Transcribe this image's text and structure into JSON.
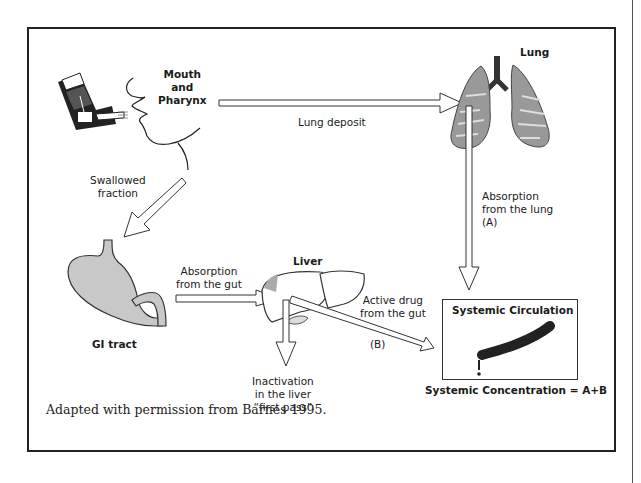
{
  "figure": {
    "caption": "Adapted with permission from Barnes 1995.",
    "nodes": {
      "mouth": {
        "label_line1": "Mouth",
        "label_line2": "and",
        "label_line3": "Pharynx",
        "icon": "inhaler-and-face-icon"
      },
      "lung": {
        "label": "Lung",
        "icon": "lungs-icon"
      },
      "gi_tract": {
        "label": "GI tract",
        "icon": "stomach-icon"
      },
      "liver": {
        "label": "Liver",
        "icon": "liver-icon"
      },
      "systemic": {
        "label": "Systemic Circulation",
        "icon": "blood-vessel-icon",
        "concentration": "Systemic Concentration = A+B"
      }
    },
    "edges": {
      "lung_deposit": {
        "label": "Lung deposit"
      },
      "swallowed": {
        "line1": "Swallowed",
        "line2": "fraction"
      },
      "absorption_lung": {
        "line1": "Absorption",
        "line2": "from the lung",
        "line3": "(A)"
      },
      "absorption_gut": {
        "line1": "Absorption",
        "line2": "from the gut"
      },
      "active_drug": {
        "line1": "Active drug",
        "line2": "from the gut",
        "tag": "(B)"
      },
      "inactivation": {
        "line1": "Inactivation",
        "line2": "in the liver",
        "line3": "“first pass”"
      }
    }
  }
}
